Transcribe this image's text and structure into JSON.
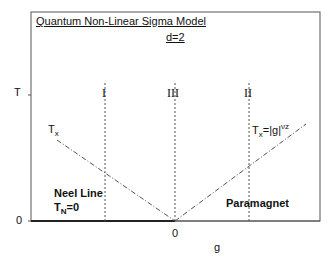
{
  "diagram": {
    "title": "Quantum Non-Linear Sigma Model",
    "subtitle": "d=2",
    "y_axis_label": "T",
    "x_axis_label": "g",
    "y_tick_zero": "0",
    "x_tick_zero": "0",
    "regions": {
      "I": "I",
      "II": "II",
      "III": "III"
    },
    "crossover_left": {
      "base": "T",
      "sub": "x"
    },
    "crossover_right": {
      "base": "T",
      "sub": "x",
      "eq": "=|g|",
      "sup": "νz"
    },
    "neel_line": {
      "line1": "Neel Line",
      "base": "T",
      "sub": "N",
      "eq": "=0"
    },
    "paramagnet": "Paramagnet"
  }
}
